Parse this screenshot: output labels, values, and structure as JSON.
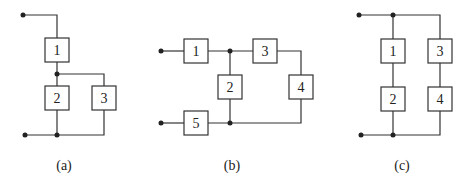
{
  "diagrams": [
    {
      "caption": "(a)",
      "blocks": [
        {
          "label": "1",
          "x": 45,
          "y": 38
        },
        {
          "label": "2",
          "x": 45,
          "y": 86
        },
        {
          "label": "3",
          "x": 92,
          "y": 86
        }
      ],
      "caption_pos": [
        64,
        165
      ]
    },
    {
      "caption": "(b)",
      "blocks": [
        {
          "label": "1",
          "x": 184,
          "y": 39
        },
        {
          "label": "2",
          "x": 218,
          "y": 75
        },
        {
          "label": "3",
          "x": 253,
          "y": 39
        },
        {
          "label": "4",
          "x": 289,
          "y": 75
        },
        {
          "label": "5",
          "x": 184,
          "y": 111
        }
      ],
      "caption_pos": [
        232,
        165
      ]
    },
    {
      "caption": "(c)",
      "blocks": [
        {
          "label": "1",
          "x": 381,
          "y": 39
        },
        {
          "label": "2",
          "x": 381,
          "y": 87
        },
        {
          "label": "3",
          "x": 428,
          "y": 39
        },
        {
          "label": "4",
          "x": 428,
          "y": 87
        }
      ],
      "caption_pos": [
        402,
        165
      ]
    }
  ],
  "box_size": [
    24,
    24
  ],
  "colors": {
    "stroke": "#333333",
    "background": "#ffffff"
  }
}
